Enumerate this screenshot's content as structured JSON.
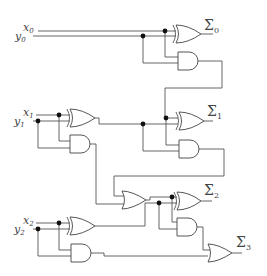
{
  "diagram": {
    "type": "logic-circuit",
    "inputs": [
      {
        "x_label": "x",
        "x_sub": "0",
        "y_label": "y",
        "y_sub": "0"
      },
      {
        "x_label": "x",
        "x_sub": "1",
        "y_label": "y",
        "y_sub": "1"
      },
      {
        "x_label": "x",
        "x_sub": "2",
        "y_label": "y",
        "y_sub": "2"
      }
    ],
    "outputs": [
      {
        "symbol": "Σ",
        "sub": "0"
      },
      {
        "symbol": "Σ",
        "sub": "1"
      },
      {
        "symbol": "Σ",
        "sub": "2"
      },
      {
        "symbol": "Σ",
        "sub": "3"
      }
    ],
    "gates": [
      {
        "id": "xor0",
        "type": "XOR"
      },
      {
        "id": "and0",
        "type": "AND"
      },
      {
        "id": "xor1a",
        "type": "XOR"
      },
      {
        "id": "and1a",
        "type": "AND"
      },
      {
        "id": "xor1b",
        "type": "XOR"
      },
      {
        "id": "and1b",
        "type": "AND"
      },
      {
        "id": "or2",
        "type": "OR"
      },
      {
        "id": "xor2a",
        "type": "XOR"
      },
      {
        "id": "and2a",
        "type": "AND"
      },
      {
        "id": "xor2b",
        "type": "XOR"
      },
      {
        "id": "and2b",
        "type": "AND"
      },
      {
        "id": "or3",
        "type": "OR"
      }
    ]
  }
}
